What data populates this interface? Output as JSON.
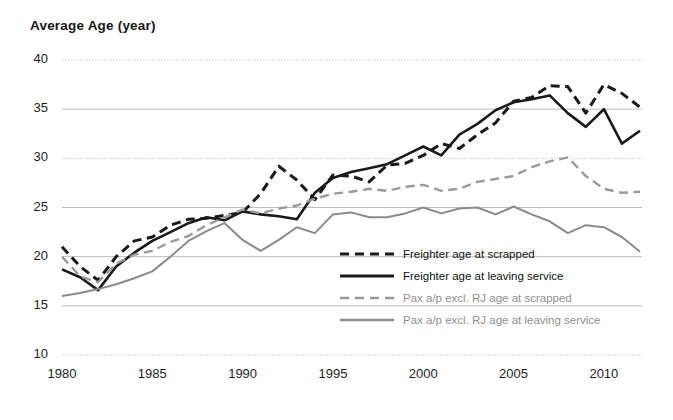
{
  "chart_data": {
    "type": "line",
    "title": "Average Age (year)",
    "xlabel": "",
    "ylabel": "Average Age (year)",
    "xlim": [
      1980,
      2012
    ],
    "ylim": [
      10,
      40
    ],
    "yticks": [
      40,
      35,
      30,
      25,
      20,
      15,
      10
    ],
    "xticks": [
      1980,
      1985,
      1990,
      1995,
      2000,
      2005,
      2010
    ],
    "grid": true,
    "legend_position": "center-right-inside",
    "x": [
      1980,
      1981,
      1982,
      1983,
      1984,
      1985,
      1986,
      1987,
      1988,
      1989,
      1990,
      1991,
      1992,
      1993,
      1994,
      1995,
      1996,
      1997,
      1998,
      1999,
      2000,
      2001,
      2002,
      2003,
      2004,
      2005,
      2006,
      2007,
      2008,
      2009,
      2010,
      2011,
      2012
    ],
    "series": [
      {
        "name": "Freighter age at scrapped",
        "color": "#1a1a1a",
        "style": "dashed",
        "values": [
          21.0,
          19.0,
          17.6,
          20.0,
          21.6,
          22.0,
          23.2,
          23.8,
          23.9,
          24.2,
          24.5,
          26.4,
          29.2,
          27.8,
          25.8,
          28.3,
          28.2,
          27.6,
          29.3,
          29.5,
          30.3,
          31.5,
          31.0,
          32.4,
          33.6,
          35.8,
          36.2,
          37.4,
          37.3,
          34.6,
          37.5,
          36.6,
          35.2
        ]
      },
      {
        "name": "Freighter age at leaving service",
        "color": "#1a1a1a",
        "style": "solid",
        "values": [
          18.7,
          17.9,
          16.6,
          19.0,
          20.4,
          21.6,
          22.5,
          23.4,
          24.0,
          23.7,
          24.6,
          24.3,
          24.1,
          23.8,
          26.5,
          28.0,
          28.6,
          29.0,
          29.4,
          30.3,
          31.2,
          30.3,
          32.4,
          33.5,
          34.9,
          35.7,
          36.0,
          36.4,
          34.6,
          33.2,
          35.0,
          31.5,
          32.8
        ]
      },
      {
        "name": "Pax a/p excl. RJ age at scrapped",
        "color": "#9a9a9a",
        "style": "dashed",
        "values": [
          20.0,
          18.0,
          17.4,
          19.3,
          20.2,
          20.6,
          21.5,
          22.1,
          23.2,
          24.0,
          24.8,
          24.4,
          24.9,
          25.2,
          25.9,
          26.4,
          26.6,
          26.9,
          26.7,
          27.1,
          27.3,
          26.7,
          26.9,
          27.6,
          27.9,
          28.2,
          29.1,
          29.7,
          30.1,
          28.2,
          26.9,
          26.5,
          26.6
        ]
      },
      {
        "name": "Pax a/p excl. RJ age  at leaving service",
        "color": "#8b8b8b",
        "style": "solid",
        "values": [
          16.0,
          16.3,
          16.7,
          17.2,
          17.8,
          18.5,
          20.0,
          21.6,
          22.6,
          23.4,
          21.7,
          20.6,
          21.7,
          23.0,
          22.4,
          24.3,
          24.5,
          24.0,
          24.0,
          24.4,
          25.0,
          24.4,
          24.9,
          25.0,
          24.3,
          25.1,
          24.3,
          23.6,
          22.4,
          23.2,
          23.0,
          22.0,
          20.5
        ]
      }
    ]
  },
  "legend": {
    "items": [
      {
        "label": "Freighter age at scrapped"
      },
      {
        "label": "Freighter age at leaving service"
      },
      {
        "label": "Pax a/p excl. RJ age at scrapped"
      },
      {
        "label": "Pax a/p excl. RJ age  at leaving service"
      }
    ]
  }
}
